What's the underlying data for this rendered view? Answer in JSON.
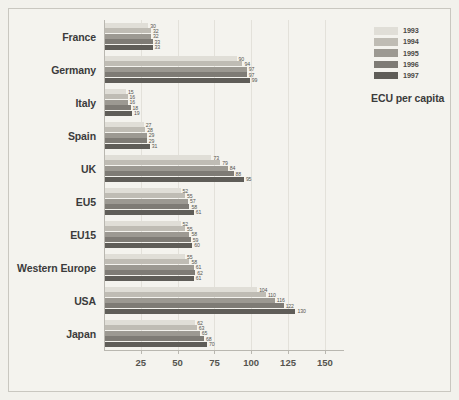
{
  "chart_data": {
    "type": "bar",
    "orientation": "horizontal",
    "title": "",
    "xlabel": "",
    "ylabel": "",
    "annotation": "ECU per capita",
    "xlim": [
      0,
      163
    ],
    "xticks": [
      25,
      50,
      75,
      100,
      125,
      150
    ],
    "grid": true,
    "legend_position": "top-right",
    "categories": [
      "France",
      "Germany",
      "Italy",
      "Spain",
      "UK",
      "EU5",
      "EU15",
      "Western Europe",
      "USA",
      "Japan"
    ],
    "series": [
      {
        "name": "1993",
        "color": "#e0ded7",
        "values": [
          30,
          90,
          15,
          27,
          73,
          52,
          52,
          55,
          104,
          62
        ]
      },
      {
        "name": "1994",
        "color": "#bfbcb4",
        "values": [
          32,
          94,
          16,
          28,
          79,
          55,
          55,
          58,
          110,
          63
        ]
      },
      {
        "name": "1995",
        "color": "#9c9992",
        "values": [
          32,
          97,
          16,
          29,
          84,
          57,
          58,
          61,
          116,
          65
        ]
      },
      {
        "name": "1996",
        "color": "#7e7b75",
        "values": [
          33,
          97,
          18,
          29,
          88,
          58,
          59,
          62,
          122,
          68
        ]
      },
      {
        "name": "1997",
        "color": "#5f5d58",
        "values": [
          33,
          99,
          19,
          31,
          95,
          61,
          60,
          61,
          130,
          70
        ]
      }
    ]
  }
}
